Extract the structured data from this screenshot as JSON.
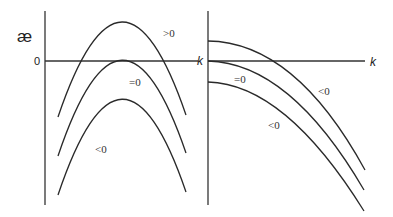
{
  "diagram": {
    "left_panel": {
      "y_axis_symbol": "æ",
      "y_origin_label": "0",
      "x_axis_label": "k",
      "curve_labels": [
        ">0",
        "=0",
        "<0"
      ]
    },
    "right_panel": {
      "x_axis_label": "k",
      "curve_labels": [
        "=0",
        "<0",
        "<0"
      ]
    }
  },
  "colors": {
    "stroke": "#2a2a2a",
    "background": "#ffffff"
  }
}
